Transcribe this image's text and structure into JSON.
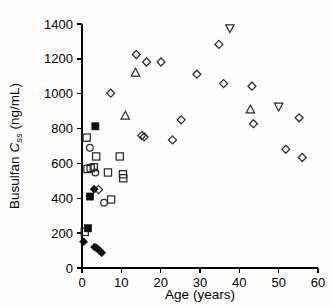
{
  "figure": {
    "background_color": "#fdfdfb",
    "marker_open_color": "#2b2b2b",
    "marker_filled_color": "#0d0d0d",
    "axis_color": "#000000"
  },
  "chart_data": {
    "type": "scatter",
    "title": "",
    "subtitle": "",
    "xlabel": "Age (years)",
    "ylabel": "Busulfan Css (ng/mL)",
    "ylabel_parts": {
      "prefix": "Busulfan ",
      "symbol": "C",
      "subscript": "ss",
      "units": " (ng/mL)"
    },
    "xlim": [
      0,
      60
    ],
    "ylim": [
      0,
      1400
    ],
    "xticks": [
      0,
      10,
      20,
      30,
      40,
      50,
      60
    ],
    "xtick_labels": [
      "0",
      "10",
      "20",
      "30",
      "40",
      "50",
      "60"
    ],
    "yticks": [
      0,
      200,
      400,
      600,
      800,
      1000,
      1200,
      1400
    ],
    "ytick_labels": [
      "0",
      "200",
      "400",
      "600",
      "800",
      "1000",
      "1200",
      "1400"
    ],
    "grid": false,
    "legend": false,
    "legend_position": "none",
    "series": [
      {
        "name": "open-diamond",
        "marker": "diamond-open",
        "filled": false,
        "points": [
          [
            4.2,
            450
          ],
          [
            7.3,
            1003
          ],
          [
            13.8,
            1225
          ],
          [
            15.2,
            760
          ],
          [
            15.8,
            752
          ],
          [
            16.4,
            1182
          ],
          [
            20.1,
            1182
          ],
          [
            23.0,
            735
          ],
          [
            25.2,
            850
          ],
          [
            29.2,
            1112
          ],
          [
            34.8,
            1283
          ],
          [
            36.0,
            1058
          ],
          [
            43.2,
            1043
          ],
          [
            43.6,
            828
          ],
          [
            51.8,
            681
          ],
          [
            55.2,
            862
          ],
          [
            56.0,
            634
          ]
        ]
      },
      {
        "name": "open-square",
        "marker": "square-open",
        "filled": false,
        "points": [
          [
            1.2,
            748
          ],
          [
            1.4,
            568
          ],
          [
            2.2,
            573
          ],
          [
            3.0,
            578
          ],
          [
            3.6,
            640
          ],
          [
            6.6,
            548
          ],
          [
            7.4,
            393
          ],
          [
            9.6,
            640
          ],
          [
            10.4,
            538
          ],
          [
            10.5,
            515
          ],
          [
            0.7,
            207
          ]
        ]
      },
      {
        "name": "open-circle",
        "marker": "circle-open",
        "filled": false,
        "points": [
          [
            2.0,
            690
          ],
          [
            3.4,
            548
          ],
          [
            5.6,
            375
          ]
        ]
      },
      {
        "name": "open-triangle-up",
        "marker": "triangle-up-open",
        "filled": false,
        "points": [
          [
            11.0,
            875
          ],
          [
            13.6,
            1122
          ],
          [
            42.8,
            910
          ]
        ]
      },
      {
        "name": "open-triangle-down",
        "marker": "triangle-down-open",
        "filled": false,
        "points": [
          [
            37.6,
            1375
          ],
          [
            50.0,
            925
          ]
        ]
      },
      {
        "name": "filled-square",
        "marker": "square-filled",
        "filled": true,
        "points": [
          [
            3.4,
            813
          ],
          [
            2.0,
            410
          ],
          [
            1.5,
            228
          ]
        ]
      },
      {
        "name": "filled-diamond",
        "marker": "diamond-filled",
        "filled": true,
        "points": [
          [
            3.1,
            452
          ],
          [
            0.4,
            150
          ],
          [
            3.2,
            120
          ],
          [
            3.7,
            115
          ],
          [
            4.4,
            100
          ],
          [
            5.0,
            88
          ]
        ]
      }
    ]
  }
}
